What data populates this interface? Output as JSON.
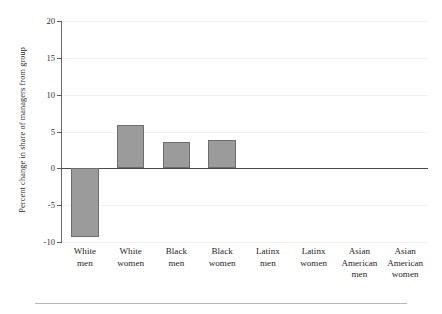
{
  "chart_data": {
    "type": "bar",
    "title": "",
    "subtitle": "",
    "xlabel": "",
    "ylabel": "Percent change in share of managers from group",
    "categories": [
      "White men",
      "White women",
      "Black men",
      "Black women",
      "Latinx men",
      "Latinx women",
      "Asian American men",
      "Asian American women"
    ],
    "category_lines": [
      [
        "White",
        "men"
      ],
      [
        "White",
        "women"
      ],
      [
        "Black",
        "men"
      ],
      [
        "Black",
        "women"
      ],
      [
        "Latinx",
        "men"
      ],
      [
        "Latinx",
        "women"
      ],
      [
        "Asian",
        "American",
        "men"
      ],
      [
        "Asian",
        "American",
        "women"
      ]
    ],
    "values": [
      -9.3,
      5.9,
      3.6,
      3.9,
      0,
      0,
      0,
      0
    ],
    "ylim": [
      -10,
      20
    ],
    "yticks": [
      20,
      15,
      10,
      5,
      0,
      -5,
      -10
    ],
    "ytick_labels": [
      "20",
      "15",
      "10",
      "5",
      "0",
      "-5",
      "-10"
    ],
    "grid": true,
    "legend": "none",
    "bar_color": "#9b9b9b",
    "bar_edge_color": "#6d6d6d",
    "axis_color": "#4a4a4a",
    "grid_color": "#f2f2f2"
  }
}
